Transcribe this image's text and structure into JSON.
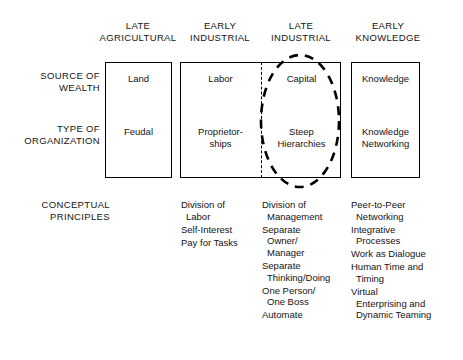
{
  "diagram": {
    "columns": [
      {
        "id": "late-agricultural",
        "line1": "LATE",
        "line2": "AGRICULTURAL"
      },
      {
        "id": "early-industrial",
        "line1": "EARLY",
        "line2": "INDUSTRIAL"
      },
      {
        "id": "late-industrial",
        "line1": "LATE",
        "line2": "INDUSTRIAL"
      },
      {
        "id": "early-knowledge",
        "line1": "EARLY",
        "line2": "KNOWLEDGE"
      }
    ],
    "rows": [
      {
        "id": "source-of-wealth",
        "line1": "SOURCE OF",
        "line2": "WEALTH"
      },
      {
        "id": "type-of-organization",
        "line1": "TYPE OF",
        "line2": "ORGANIZATION"
      }
    ],
    "cells": {
      "source_of_wealth": {
        "late_agricultural": "Land",
        "early_industrial": "Labor",
        "late_industrial": "Capital",
        "early_knowledge": "Knowledge"
      },
      "type_of_organization": {
        "late_agricultural": "Feudal",
        "early_industrial_l1": "Proprietor-",
        "early_industrial_l2": "ships",
        "late_industrial_l1": "Steep",
        "late_industrial_l2": "Hierarchies",
        "early_knowledge_l1": "Knowledge",
        "early_knowledge_l2": "Networking"
      }
    },
    "conceptual_principles": {
      "label_line1": "CONCEPTUAL",
      "label_line2": "PRINCIPLES",
      "early_industrial": [
        {
          "lines": [
            "Division of",
            "Labor"
          ]
        },
        {
          "lines": [
            "Self-Interest"
          ]
        },
        {
          "lines": [
            "Pay for Tasks"
          ]
        }
      ],
      "late_industrial": [
        {
          "lines": [
            "Division of",
            "Management"
          ]
        },
        {
          "lines": [
            "Separate",
            "Owner/",
            "Manager"
          ]
        },
        {
          "lines": [
            "Separate",
            "Thinking/Doing"
          ]
        },
        {
          "lines": [
            "One Person/",
            "One Boss"
          ]
        },
        {
          "lines": [
            "Automate"
          ]
        }
      ],
      "early_knowledge": [
        {
          "lines": [
            "Peer-to-Peer",
            "Networking"
          ]
        },
        {
          "lines": [
            "Integrative",
            "Processes"
          ]
        },
        {
          "lines": [
            "Work as Dialogue"
          ]
        },
        {
          "lines": [
            "Human Time and",
            "Timing"
          ]
        },
        {
          "lines": [
            "Virtual",
            "Enterprising and",
            "Dynamic Teaming"
          ]
        }
      ]
    },
    "annotation": {
      "highlight_shape": "dashed-ellipse",
      "highlight_target": "late-industrial-column"
    },
    "colors": {
      "background": "#ffffff",
      "ink": "#141414",
      "stroke": "#000000"
    }
  }
}
